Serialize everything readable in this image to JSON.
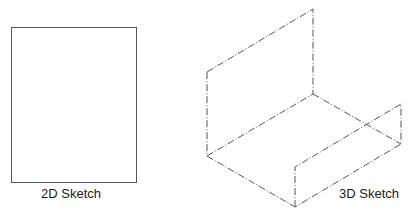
{
  "figures": [
    {
      "id": "2d",
      "label": "2D Sketch"
    },
    {
      "id": "3d",
      "label": "3D Sketch"
    }
  ],
  "colors": {
    "line": "#444444",
    "text": "#1a1a1a",
    "background": "#ffffff"
  }
}
